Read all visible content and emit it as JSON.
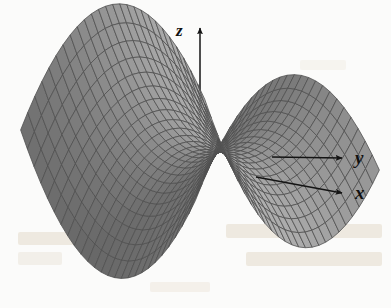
{
  "figure": {
    "background_color": "#fbfbfa",
    "width": 391,
    "height": 308
  },
  "axes": {
    "z": {
      "label": "z",
      "icon": "arrow-up-icon",
      "arrow_direction": "up"
    },
    "y": {
      "label": "y",
      "icon": "arrow-right-icon",
      "arrow_direction": "right"
    },
    "x": {
      "label": "x",
      "icon": "arrow-right-icon",
      "arrow_direction": "right"
    }
  },
  "colors": {
    "mesh_line": "#1a1a1a",
    "fill_dark": "#5f5f5f",
    "fill_mid": "#7c7c7c",
    "fill_light": "#a6a6a6",
    "axis_line": "#1a1a1a",
    "background": "#fbfbfa",
    "page_bleed": "#eae3d7"
  },
  "chart_data": {
    "type": "surface",
    "title": "",
    "xlabel": "x",
    "ylabel": "y",
    "zlabel": "z",
    "function": "z = x^2 - y^2",
    "grid": true,
    "legend": false,
    "xlim": [
      -1,
      1
    ],
    "ylim": [
      -1,
      1
    ],
    "zlim": [
      -1,
      1
    ],
    "mesh": {
      "nu": 26,
      "nv": 26
    },
    "projection": {
      "type": "oblique-orthographic",
      "origin_px": [
        200,
        150
      ],
      "x_axis_px": [
        0.74,
        0.3
      ],
      "y_axis_px": [
        0.78,
        -0.13
      ],
      "z_axis_px": [
        0.0,
        -1.06
      ],
      "scale_x": 118,
      "scale_y": 118,
      "scale_z": 104
    },
    "lighting": {
      "shade_min": "#4f4f4f",
      "shade_max": "#b4b4b4"
    },
    "features": [
      {
        "name": "saddle-point",
        "xyz": [
          0,
          0,
          0
        ]
      },
      {
        "name": "ridge-crest-back",
        "xyz": [
          -1,
          0,
          1
        ]
      },
      {
        "name": "ridge-crest-front",
        "xyz": [
          1,
          0,
          1
        ]
      },
      {
        "name": "valley-left",
        "xyz": [
          0,
          -1,
          -1
        ]
      },
      {
        "name": "valley-right",
        "xyz": [
          0,
          1,
          -1
        ]
      }
    ]
  }
}
